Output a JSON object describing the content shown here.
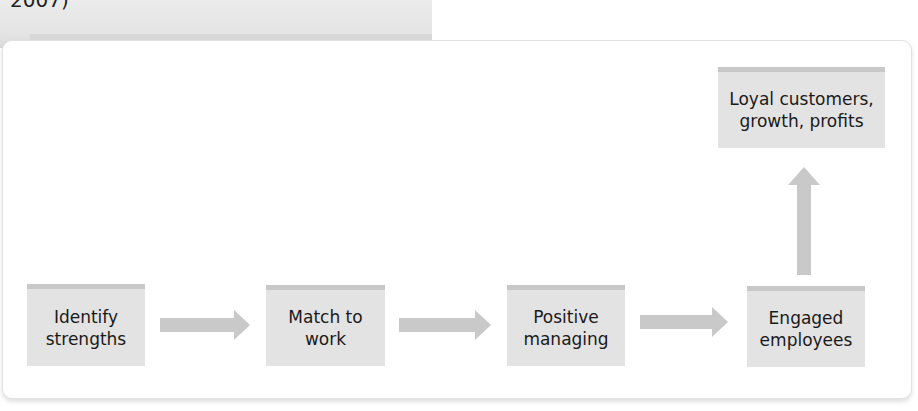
{
  "caption": {
    "text": "2007)"
  },
  "diagram": {
    "nodes": [
      {
        "id": "identify",
        "label": "Identify\nstrengths",
        "line1": "Identify",
        "line2": "strengths"
      },
      {
        "id": "match",
        "label": "Match to\nwork",
        "line1": "Match to",
        "line2": "work"
      },
      {
        "id": "positive",
        "label": "Positive\nmanaging",
        "line1": "Positive",
        "line2": "managing"
      },
      {
        "id": "engaged",
        "label": "Engaged\nemployees",
        "line1": "Engaged",
        "line2": "employees"
      },
      {
        "id": "loyal",
        "label": "Loyal customers,\ngrowth, profits",
        "line1": "Loyal customers,",
        "line2": "growth, profits"
      }
    ],
    "edges": [
      {
        "from": "identify",
        "to": "match",
        "direction": "right"
      },
      {
        "from": "match",
        "to": "positive",
        "direction": "right"
      },
      {
        "from": "positive",
        "to": "engaged",
        "direction": "right"
      },
      {
        "from": "engaged",
        "to": "loyal",
        "direction": "up"
      }
    ],
    "colors": {
      "box_fill": "#e3e3e3",
      "box_top_bar": "#c8c8c8",
      "arrow": "#c9c9c9",
      "text": "#1a1a1a"
    }
  }
}
